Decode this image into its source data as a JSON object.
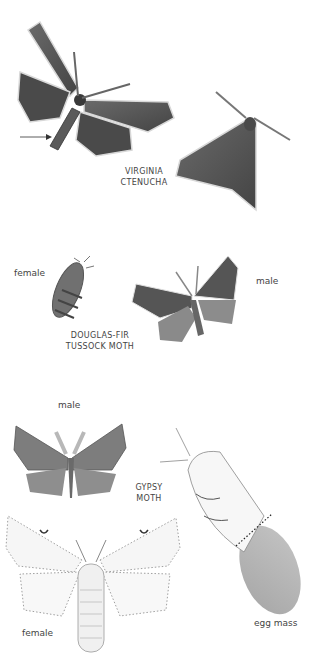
{
  "plate": {
    "background": "#ffffff",
    "colors": {
      "dark_moth": "#555555",
      "dark_moth_edge": "#3a3a3a",
      "tussock_female": "#6e6e6e",
      "tussock_male_fore": "#5a5a5a",
      "tussock_male_hind": "#8a8a8a",
      "gypsy_male": "#7a7a7a",
      "gypsy_female": "#f4f4f4",
      "egg_mass": "#b5b5b5",
      "label_text": "#444444"
    }
  },
  "groups": [
    {
      "id": "virginia-ctenucha",
      "name_lines": [
        "VIRGINIA",
        "CTENUCHA"
      ],
      "figures": [
        "spread specimen with arrow pointing to abdomen",
        "resting specimen"
      ]
    },
    {
      "id": "douglas-fir-tussock-moth",
      "name_lines": [
        "DOUGLAS-FIR",
        "TUSSOCK MOTH"
      ],
      "figures": [
        "female",
        "male"
      ],
      "labels": {
        "female": "female",
        "male": "male"
      }
    },
    {
      "id": "gypsy-moth",
      "name_lines": [
        "GYPSY",
        "MOTH"
      ],
      "figures": [
        "male",
        "female",
        "female on egg mass"
      ],
      "labels": {
        "male": "male",
        "female": "female",
        "egg_mass": "egg mass"
      }
    }
  ]
}
